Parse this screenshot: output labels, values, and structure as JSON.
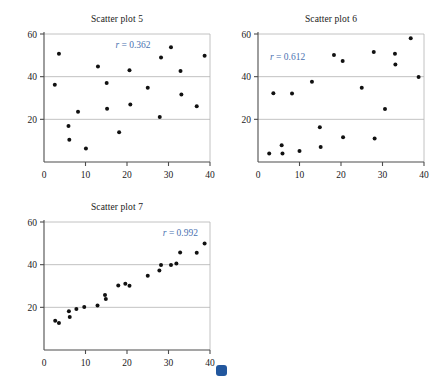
{
  "figure": {
    "background": "#ffffff",
    "marker_color": "#111111",
    "axis_color": "#4d4d4d",
    "grid_color": "#b3b3b3",
    "r_label_color": "#4a72b0"
  },
  "badge": {
    "name": "blue-dot-marker",
    "color": "#22579e",
    "x": 216,
    "y": 365,
    "size": 11
  },
  "chart_data": [
    {
      "type": "scatter",
      "title": "Scatter plot 5",
      "xlabel": "",
      "ylabel": "",
      "xlim": [
        0,
        40
      ],
      "ylim": [
        0,
        60
      ],
      "xticks": [
        0,
        10,
        20,
        30,
        40
      ],
      "yticks": [
        20,
        40,
        60
      ],
      "grid": "horizontal",
      "annotation": "r = 0.362",
      "annotation_value": 0.362,
      "annotation_position": "top-center",
      "points": [
        [
          2.6,
          36.2
        ],
        [
          3.6,
          50.8
        ],
        [
          5.9,
          16.9
        ],
        [
          6.1,
          10.4
        ],
        [
          8.2,
          23.6
        ],
        [
          10.1,
          6.3
        ],
        [
          13.0,
          44.8
        ],
        [
          15.1,
          37.0
        ],
        [
          15.2,
          25.0
        ],
        [
          18.1,
          13.9
        ],
        [
          20.6,
          43.0
        ],
        [
          20.8,
          27.0
        ],
        [
          25.0,
          34.8
        ],
        [
          27.9,
          21.1
        ],
        [
          28.2,
          49.0
        ],
        [
          30.6,
          53.8
        ],
        [
          32.9,
          42.6
        ],
        [
          33.1,
          31.6
        ],
        [
          36.8,
          26.1
        ],
        [
          38.7,
          49.8
        ]
      ]
    },
    {
      "type": "scatter",
      "title": "Scatter plot 6",
      "xlabel": "",
      "ylabel": "",
      "xlim": [
        0,
        40
      ],
      "ylim": [
        0,
        60
      ],
      "xticks": [
        0,
        10,
        20,
        30,
        40
      ],
      "yticks": [
        20,
        40,
        60
      ],
      "grid": "horizontal",
      "annotation": "r = 0.612",
      "annotation_value": 0.612,
      "annotation_position": "top-left",
      "points": [
        [
          2.7,
          4.0
        ],
        [
          3.7,
          32.2
        ],
        [
          5.7,
          7.8
        ],
        [
          5.9,
          4.0
        ],
        [
          8.2,
          32.1
        ],
        [
          10.0,
          5.2
        ],
        [
          13.0,
          37.6
        ],
        [
          14.9,
          16.3
        ],
        [
          15.1,
          7.0
        ],
        [
          18.3,
          50.2
        ],
        [
          20.4,
          47.4
        ],
        [
          20.5,
          11.6
        ],
        [
          25.0,
          34.8
        ],
        [
          27.9,
          51.6
        ],
        [
          28.1,
          11.0
        ],
        [
          30.6,
          24.8
        ],
        [
          33.0,
          50.8
        ],
        [
          33.1,
          45.7
        ],
        [
          36.8,
          58.0
        ],
        [
          38.7,
          39.9
        ]
      ]
    },
    {
      "type": "scatter",
      "title": "Scatter plot 7",
      "xlabel": "",
      "ylabel": "",
      "xlim": [
        0,
        40
      ],
      "ylim": [
        0,
        60
      ],
      "xticks": [
        0,
        10,
        20,
        30,
        40
      ],
      "yticks": [
        20,
        40,
        60
      ],
      "grid": "horizontal",
      "annotation": "r = 0.992",
      "annotation_value": 0.992,
      "annotation_position": "top-right",
      "points": [
        [
          2.7,
          13.7
        ],
        [
          3.6,
          12.6
        ],
        [
          6.0,
          18.2
        ],
        [
          6.2,
          15.5
        ],
        [
          7.8,
          19.2
        ],
        [
          9.7,
          20.1
        ],
        [
          12.9,
          20.9
        ],
        [
          14.7,
          25.8
        ],
        [
          14.9,
          23.9
        ],
        [
          17.9,
          30.2
        ],
        [
          19.6,
          31.0
        ],
        [
          20.6,
          30.1
        ],
        [
          25.0,
          34.8
        ],
        [
          27.8,
          37.3
        ],
        [
          28.2,
          39.8
        ],
        [
          30.6,
          39.8
        ],
        [
          31.9,
          40.5
        ],
        [
          32.8,
          45.7
        ],
        [
          36.8,
          45.6
        ],
        [
          38.7,
          49.9
        ]
      ]
    }
  ]
}
